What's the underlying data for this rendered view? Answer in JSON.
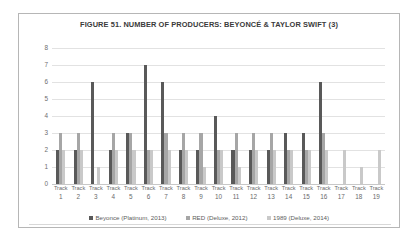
{
  "chart_data": {
    "type": "bar",
    "title": "FIGURE 51. NUMBER OF PRODUCERS: BEYONCÉ & TAYLOR SWIFT (3)",
    "xlabel": "",
    "ylabel": "",
    "ylim": [
      0,
      8
    ],
    "yticks": [
      0,
      1,
      2,
      3,
      4,
      5,
      6,
      7,
      8
    ],
    "grid": true,
    "legend_position": "bottom",
    "category_prefix": "Track",
    "categories": [
      "1",
      "2",
      "3",
      "4",
      "5",
      "6",
      "7",
      "8",
      "9",
      "10",
      "11",
      "12",
      "13",
      "14",
      "15",
      "16",
      "17",
      "18",
      "19"
    ],
    "series": [
      {
        "name": "Beyonce (Platinum, 2013)",
        "color": "#595959",
        "values": [
          2,
          2,
          6,
          2,
          3,
          7,
          6,
          2,
          2,
          4,
          2,
          2,
          2,
          3,
          3,
          6,
          0,
          0,
          0
        ]
      },
      {
        "name": "RED (Deluxe, 2012)",
        "color": "#a6a6a6",
        "values": [
          3,
          3,
          0,
          3,
          3,
          2,
          3,
          3,
          3,
          2,
          3,
          3,
          3,
          2,
          2,
          3,
          0,
          0,
          0
        ]
      },
      {
        "name": "1989 (Deluxe, 2014)",
        "color": "#c9c9c9",
        "values": [
          2,
          2,
          1,
          2,
          2,
          2,
          2,
          2,
          1,
          2,
          1,
          2,
          2,
          2,
          2,
          2,
          2,
          1,
          2
        ]
      }
    ]
  }
}
